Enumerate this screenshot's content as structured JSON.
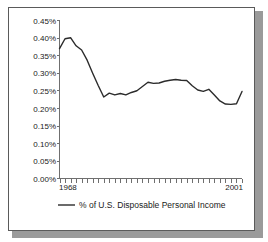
{
  "chart_data": {
    "type": "line",
    "title": "",
    "xlabel": "",
    "ylabel": "",
    "ylim": [
      0.0,
      0.45
    ],
    "xlim": [
      1968,
      2001
    ],
    "grid": false,
    "legend_position": "bottom",
    "y_tick_labels": [
      "0.45%",
      "0.40%",
      "0.35%",
      "0.30%",
      "0.25%",
      "0.20%",
      "0.15%",
      "0.10%",
      "0.05%",
      "0.00%"
    ],
    "y_tick_values": [
      0.45,
      0.4,
      0.35,
      0.3,
      0.25,
      0.2,
      0.15,
      0.1,
      0.05,
      0.0
    ],
    "x_tick_labels": [
      "1968",
      "2001"
    ],
    "x_tick_values": [
      1968,
      2001
    ],
    "legend": [
      "% of U.S. Disposable Personal Income"
    ],
    "series": [
      {
        "name": "% of U.S. Disposable Personal Income",
        "x": [
          1968,
          1969,
          1970,
          1971,
          1972,
          1973,
          1974,
          1975,
          1976,
          1977,
          1978,
          1979,
          1980,
          1981,
          1982,
          1983,
          1984,
          1985,
          1986,
          1987,
          1988,
          1989,
          1990,
          1991,
          1992,
          1993,
          1994,
          1995,
          1996,
          1997,
          1998,
          1999,
          2000,
          2001
        ],
        "values": [
          0.37,
          0.398,
          0.401,
          0.378,
          0.366,
          0.337,
          0.3,
          0.265,
          0.232,
          0.243,
          0.238,
          0.242,
          0.238,
          0.245,
          0.25,
          0.262,
          0.274,
          0.271,
          0.272,
          0.277,
          0.28,
          0.282,
          0.28,
          0.279,
          0.264,
          0.252,
          0.248,
          0.254,
          0.238,
          0.221,
          0.212,
          0.211,
          0.213,
          0.248
        ]
      }
    ]
  },
  "legend": {
    "marker": "line-marker",
    "label": "% of U.S. Disposable Personal Income"
  },
  "axis": {
    "x_start_label": "1968",
    "x_end_label": "2001",
    "y_labels": [
      "0.45%",
      "0.40%",
      "0.35%",
      "0.30%",
      "0.25%",
      "0.20%",
      "0.15%",
      "0.10%",
      "0.05%",
      "0.00%"
    ]
  },
  "colors": {
    "line": "#2b2b2b",
    "axis": "#6f6f6f",
    "frame": "#5a5a5a",
    "shadow": "#9a9a9a",
    "background": "#ffffff"
  }
}
